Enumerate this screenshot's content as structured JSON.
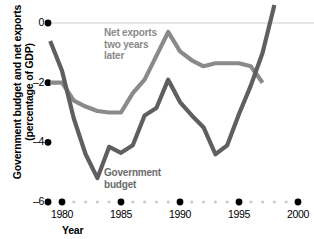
{
  "chart_data": {
    "type": "line",
    "title": "",
    "xlabel": "Year",
    "ylabel": "Government budget and net exports (percentage of GDP)",
    "ylabel_line1": "Government budget and net exports",
    "ylabel_line2": "(percentage of GDP)",
    "xlim": [
      1979,
      2000
    ],
    "ylim": [
      -6,
      0.8
    ],
    "yticks": [
      0,
      -2,
      -4,
      -6
    ],
    "ytick_labels": [
      "0",
      "–2",
      "–4",
      "–6"
    ],
    "xticks": [
      1980,
      1985,
      1990,
      1995,
      2000
    ],
    "xtick_labels": [
      "1980",
      "1985",
      "1990",
      "1995",
      "2000"
    ],
    "grid": false,
    "zero_line": true,
    "legend_position": "inline-annotations",
    "series": [
      {
        "name": "Net exports two years later",
        "color": "#8a8a8a",
        "label_text": "Net exports\ntwo years\nlater",
        "x": [
          1979.0,
          1980.0,
          1981.0,
          1982.0,
          1983.0,
          1984.0,
          1985.0,
          1986.0,
          1987.0,
          1988.0,
          1989.0,
          1990.0,
          1991.0,
          1992.0,
          1993.0,
          1994.0,
          1995.0,
          1996.0,
          1997.0
        ],
        "values": [
          -2.0,
          -2.0,
          -2.6,
          -2.8,
          -2.95,
          -3.0,
          -3.0,
          -2.35,
          -1.9,
          -1.1,
          -0.3,
          -0.95,
          -1.25,
          -1.45,
          -1.35,
          -1.35,
          -1.35,
          -1.45,
          -2.0
        ]
      },
      {
        "name": "Government budget",
        "color": "#5f5f5f",
        "label_text": "Government\nbudget",
        "x": [
          1979.0,
          1980.0,
          1981.0,
          1982.0,
          1983.0,
          1984.0,
          1985.0,
          1986.0,
          1987.0,
          1988.0,
          1989.0,
          1990.0,
          1991.0,
          1992.0,
          1993.0,
          1994.0,
          1995.0,
          1996.0,
          1997.0,
          1998.0
        ],
        "values": [
          -0.6,
          -1.6,
          -3.2,
          -4.4,
          -5.2,
          -4.15,
          -4.35,
          -4.1,
          -3.1,
          -2.85,
          -1.9,
          -2.65,
          -3.1,
          -3.5,
          -4.4,
          -4.1,
          -3.05,
          -2.1,
          -1.0,
          0.6
        ]
      }
    ]
  },
  "axes": {
    "y_title_line1": "Government budget and net exports",
    "y_title_line2": "(percentage of GDP)",
    "x_title": "Year"
  },
  "labels": {
    "net_exports_l1": "Net exports",
    "net_exports_l2": "two years",
    "net_exports_l3": "later",
    "gov_budget_l1": "Government",
    "gov_budget_l2": "budget"
  },
  "colors": {
    "net_exports": "#8a8a8a",
    "gov_budget": "#5f5f5f",
    "zero_line": "#dedede",
    "dot_major": "#000000",
    "dot_minor": "#c9c9c9",
    "text": "#000000"
  }
}
